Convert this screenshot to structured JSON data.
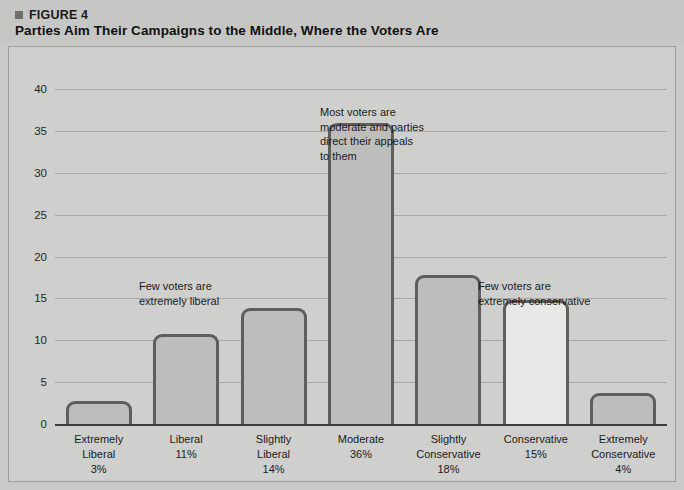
{
  "figure": {
    "label": "FIGURE 4",
    "bullet_icon": "square-bullet-icon",
    "title": "Parties Aim Their Campaigns to the Middle, Where the Voters Are"
  },
  "colors": {
    "page_background": "#c9c9c7",
    "panel_background": "#cfcfcd",
    "panel_border": "#9d9d9b",
    "bar_outline": "#5e5e5c",
    "bar_fill_default": "#bdbdbb",
    "bar_fill_highlight": "#e8e8e6",
    "gridline": "#a8a8a6",
    "axis_line": "#3a3a3a",
    "text": "#1b1b1b"
  },
  "chart_data": {
    "type": "bar",
    "title": "Parties Aim Their Campaigns to the Middle, Where the Voters Are",
    "xlabel": "",
    "ylabel": "",
    "ylim": [
      0,
      42
    ],
    "grid": true,
    "legend": "none",
    "yticks": [
      0,
      5,
      10,
      15,
      20,
      25,
      30,
      35,
      40
    ],
    "ytick_labels": [
      "0",
      "5",
      "10",
      "15",
      "20",
      "25",
      "30",
      "35",
      "40"
    ],
    "categories": [
      "Extremely Liberal",
      "Liberal",
      "Slightly Liberal",
      "Moderate",
      "Slightly Conservative",
      "Conservative",
      "Extremely Conservative"
    ],
    "category_labels": [
      "Extremely\nLiberal\n3%",
      "Liberal\n11%",
      "Slightly\nLiberal\n14%",
      "Moderate\n36%",
      "Slightly\nConservative\n18%",
      "Conservative\n15%",
      "Extremely\nConservative\n4%"
    ],
    "percent_labels": [
      "3%",
      "11%",
      "14%",
      "36%",
      "18%",
      "15%",
      "4%"
    ],
    "values": [
      2.7,
      10.8,
      13.8,
      36,
      17.8,
      14.8,
      3.7
    ],
    "reported_percents": [
      3,
      11,
      14,
      36,
      18,
      15,
      4
    ],
    "highlight_index": 5,
    "annotations": [
      {
        "name": "annotation-few-liberal",
        "text": "Few voters are\nextremely liberal",
        "x": 130,
        "y": 232
      },
      {
        "name": "annotation-most-moderate",
        "text": "Most voters are\nmoderate and parties\ndirect their appeals\nto them",
        "x": 311,
        "y": 58
      },
      {
        "name": "annotation-few-conservative",
        "text": "Few voters are\nextremely conservative",
        "x": 469,
        "y": 232
      }
    ]
  }
}
